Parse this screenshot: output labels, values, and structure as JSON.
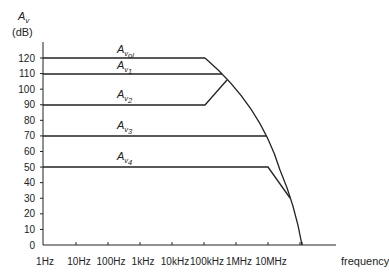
{
  "chart_data": {
    "type": "line",
    "title": "",
    "ylabel": "A_v (dB)",
    "ylabel_main": "A",
    "ylabel_sub": "v",
    "ylabel_unit": "(dB)",
    "xlabel": "frequency",
    "xscale": "log",
    "x_ticks": [
      "1Hz",
      "10Hz",
      "100Hz",
      "1kHz",
      "10kHz",
      "100kHz",
      "1MHz",
      "10MHz"
    ],
    "y_ticks": [
      0,
      10,
      20,
      30,
      40,
      50,
      60,
      70,
      80,
      90,
      100,
      110,
      120
    ],
    "ylim": [
      0,
      120
    ],
    "grid": false,
    "legend": "inline labels above each line",
    "series": [
      {
        "name": "A_vol",
        "label_main": "A",
        "label_sub": "v",
        "label_subsub": "ol",
        "points": [
          [
            1,
            120
          ],
          [
            100000,
            120
          ],
          [
            1000000,
            100
          ],
          [
            10000000,
            70
          ],
          [
            60000000,
            0
          ]
        ]
      },
      {
        "name": "A_v1",
        "label_main": "A",
        "label_sub": "v",
        "label_subsub": "1",
        "points": [
          [
            1,
            110
          ],
          [
            500000,
            110
          ]
        ]
      },
      {
        "name": "A_v2",
        "label_main": "A",
        "label_sub": "v",
        "label_subsub": "2",
        "points": [
          [
            1,
            90
          ],
          [
            100000,
            90
          ],
          [
            700000,
            105
          ]
        ]
      },
      {
        "name": "A_v3",
        "label_main": "A",
        "label_sub": "v",
        "label_subsub": "3",
        "points": [
          [
            1,
            70
          ],
          [
            10000000,
            70
          ]
        ]
      },
      {
        "name": "A_v4",
        "label_main": "A",
        "label_sub": "v",
        "label_subsub": "4",
        "points": [
          [
            1,
            50
          ],
          [
            10000000,
            50
          ],
          [
            30000000,
            30
          ]
        ]
      }
    ],
    "envelope": "open-loop A_vol roll-off curve bounding all closed-loop gains"
  }
}
